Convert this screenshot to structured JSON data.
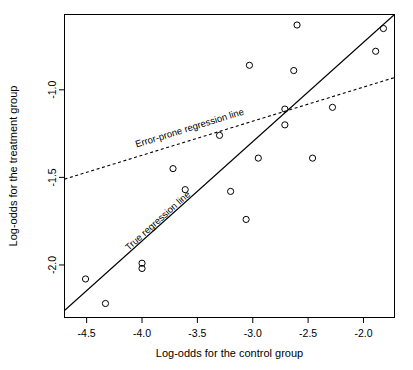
{
  "figure": {
    "background_color": "#ffffff",
    "foreground_color": "#000000"
  },
  "chart_data": {
    "type": "scatter",
    "title": "",
    "xlabel": "Log-odds for the control group",
    "ylabel": "Log-odds for the treatment group",
    "xlim": [
      -4.7,
      -1.72
    ],
    "ylim": [
      -2.3,
      -0.57
    ],
    "xticks": [
      -4.5,
      -4.0,
      -3.5,
      -3.0,
      -2.5,
      -2.0
    ],
    "xticklabels": [
      "-4.5",
      "-4.0",
      "-3.5",
      "-3.0",
      "-2.5",
      "-2.0"
    ],
    "yticks": [
      -1.0,
      -1.5,
      -2.0
    ],
    "yticklabels": [
      "-1.0",
      "-1.5",
      "-2.0"
    ],
    "grid": false,
    "legend": "none",
    "marker": "open-circle",
    "points": [
      {
        "x": -2.6,
        "y": -0.63
      },
      {
        "x": -1.82,
        "y": -0.65
      },
      {
        "x": -1.89,
        "y": -0.78
      },
      {
        "x": -3.03,
        "y": -0.86
      },
      {
        "x": -2.63,
        "y": -0.89
      },
      {
        "x": -2.71,
        "y": -1.11
      },
      {
        "x": -2.28,
        "y": -1.1
      },
      {
        "x": -2.71,
        "y": -1.2
      },
      {
        "x": -3.3,
        "y": -1.26
      },
      {
        "x": -2.95,
        "y": -1.39
      },
      {
        "x": -2.46,
        "y": -1.39
      },
      {
        "x": -3.72,
        "y": -1.45
      },
      {
        "x": -3.61,
        "y": -1.57
      },
      {
        "x": -3.2,
        "y": -1.58
      },
      {
        "x": -3.06,
        "y": -1.74
      },
      {
        "x": -4.0,
        "y": -1.99
      },
      {
        "x": -4.0,
        "y": -2.02
      },
      {
        "x": -4.51,
        "y": -2.08
      },
      {
        "x": -4.33,
        "y": -2.22
      }
    ],
    "lines": [
      {
        "name": "true-regression-line",
        "label": "True regression line",
        "style": "solid",
        "x0": -4.7,
        "y0": -2.26,
        "x1": -1.72,
        "y1": -0.57,
        "label_x": -4.12,
        "label_y": -1.92
      },
      {
        "name": "error-prone-regression-line",
        "label": "Error-prone regression line",
        "style": "dashed",
        "x0": -4.7,
        "y0": -1.51,
        "x1": -1.72,
        "y1": -0.93,
        "label_x": -4.05,
        "label_y": -1.33
      }
    ]
  }
}
